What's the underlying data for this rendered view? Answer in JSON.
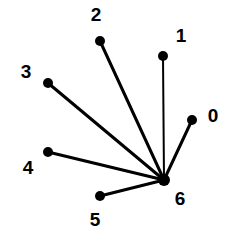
{
  "figure": {
    "kind": "node-link-diagram",
    "background_color": "#ffffff",
    "ink_color": "#000000",
    "width": 237,
    "height": 248
  },
  "chart_data": {
    "type": "scatter",
    "title": "",
    "xlabel": "",
    "ylabel": "",
    "grid": false,
    "legend": false,
    "layout": "star graph with hub node 6 and six leaf nodes 0-5",
    "nodes": [
      {
        "id": "0",
        "label": "0",
        "x": 192,
        "y": 120,
        "label_x": 213,
        "label_y": 117,
        "radius": 5
      },
      {
        "id": "1",
        "label": "1",
        "x": 163,
        "y": 56,
        "label_x": 181,
        "label_y": 37,
        "radius": 5
      },
      {
        "id": "2",
        "label": "2",
        "x": 100,
        "y": 41,
        "label_x": 96,
        "label_y": 16,
        "radius": 5
      },
      {
        "id": "3",
        "label": "3",
        "x": 48,
        "y": 83,
        "label_x": 26,
        "label_y": 73,
        "radius": 5
      },
      {
        "id": "4",
        "label": "4",
        "x": 48,
        "y": 152,
        "label_x": 28,
        "label_y": 169,
        "radius": 5
      },
      {
        "id": "5",
        "label": "5",
        "x": 100,
        "y": 196,
        "label_x": 95,
        "label_y": 221,
        "radius": 5
      },
      {
        "id": "6",
        "label": "6",
        "x": 164,
        "y": 180,
        "label_x": 180,
        "label_y": 200,
        "radius": 6
      }
    ],
    "edges": [
      {
        "source": "6",
        "target": "0",
        "width": 3
      },
      {
        "source": "6",
        "target": "1",
        "width": 2
      },
      {
        "source": "6",
        "target": "2",
        "width": 3
      },
      {
        "source": "6",
        "target": "3",
        "width": 3
      },
      {
        "source": "6",
        "target": "4",
        "width": 3
      },
      {
        "source": "6",
        "target": "5",
        "width": 3
      }
    ]
  }
}
